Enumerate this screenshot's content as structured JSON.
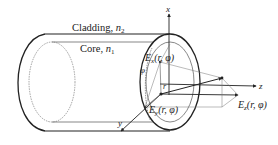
{
  "diagram": {
    "type": "optical-fiber-field-components",
    "labels": {
      "cladding": "Cladding, ",
      "cladding_sym": "n",
      "cladding_sub": "2",
      "core": "Core, ",
      "core_sym": "n",
      "core_sub": "1",
      "axis_x": "x",
      "axis_y": "y",
      "axis_z": "z",
      "r": "r",
      "phi": "φ",
      "ex": "E",
      "ex_sub": "x",
      "ex_args": "(r, φ)",
      "ey": "E",
      "ey_sub": "y",
      "ey_args": "(r, φ)",
      "ez": "E",
      "ez_sub": "z",
      "ez_args": "(r, φ)"
    },
    "colors": {
      "stroke": "#222222",
      "thin_stroke": "#555555",
      "background": "#ffffff"
    }
  }
}
